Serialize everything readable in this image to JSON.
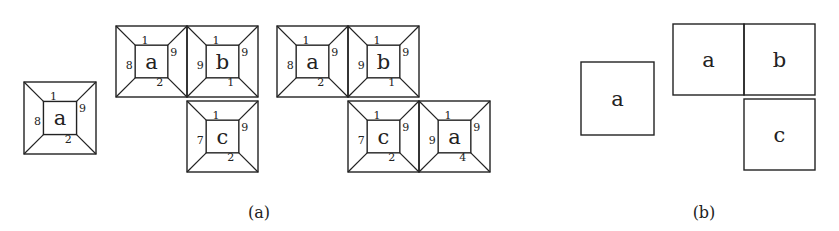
{
  "panels": [
    {
      "id": "a",
      "caption": "(a)",
      "caption_pos": [
        259,
        212
      ],
      "tiles": [
        {
          "label": "a",
          "x": 24,
          "y": 82,
          "size": 72,
          "top": "1",
          "right": "9",
          "bottom": "2",
          "left": "8"
        },
        {
          "label": "a",
          "x": 116,
          "y": 26,
          "size": 71,
          "top": "1",
          "right": "9",
          "bottom": "2",
          "left": "8"
        },
        {
          "label": "b",
          "x": 187,
          "y": 26,
          "size": 71,
          "top": "1",
          "right": "9",
          "bottom": "1",
          "left": "9"
        },
        {
          "label": "c",
          "x": 187,
          "y": 101,
          "size": 71,
          "top": "1",
          "right": "9",
          "bottom": "2",
          "left": "7"
        },
        {
          "label": "a",
          "x": 277,
          "y": 26,
          "size": 71,
          "top": "1",
          "right": "9",
          "bottom": "2",
          "left": "8"
        },
        {
          "label": "b",
          "x": 348,
          "y": 26,
          "size": 71,
          "top": "1",
          "right": "9",
          "bottom": "1",
          "left": "9"
        },
        {
          "label": "c",
          "x": 348,
          "y": 101,
          "size": 71,
          "top": "1",
          "right": "9",
          "bottom": "2",
          "left": "7"
        },
        {
          "label": "a",
          "x": 419,
          "y": 101,
          "size": 71,
          "top": "1",
          "right": "9",
          "bottom": "4",
          "left": "9"
        }
      ]
    },
    {
      "id": "b",
      "caption": "(b)",
      "caption_pos": [
        704,
        212
      ],
      "squares": [
        {
          "label": "a",
          "x": 581,
          "y": 62,
          "size": 73
        },
        {
          "label": "a",
          "x": 673,
          "y": 24,
          "size": 71
        },
        {
          "label": "b",
          "x": 744,
          "y": 24,
          "size": 71
        },
        {
          "label": "c",
          "x": 744,
          "y": 99,
          "size": 71
        }
      ]
    }
  ]
}
